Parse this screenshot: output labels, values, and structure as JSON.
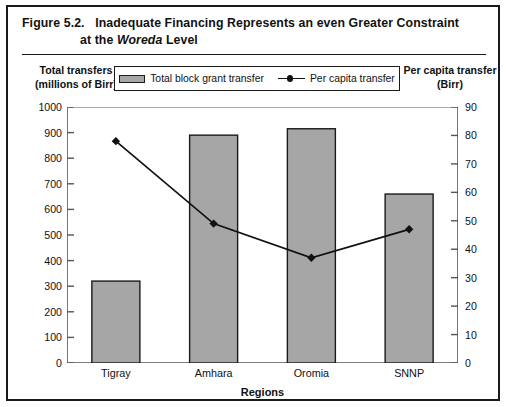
{
  "figure": {
    "number": "Figure 5.2.",
    "title_line1": "Inadequate Financing Represents an even Greater Constraint",
    "title_line2_prefix": "at the ",
    "title_line2_italic": "Woreda",
    "title_line2_suffix": " Level"
  },
  "legend": {
    "position": "top-center",
    "items": [
      {
        "label": "Total block grant transfer",
        "marker": "filled-rect-swatch",
        "color": "#a6a6a6"
      },
      {
        "label": "Per capita transfer",
        "marker": "line-with-dot",
        "color": "#111111"
      }
    ]
  },
  "axes": {
    "left_title_line1": "Total transfers",
    "left_title_line2": "(millions of Birr)",
    "right_title_line1": "Per capita transfer",
    "right_title_line2": "(Birr)",
    "x_title": "Regions",
    "left_ticks": [
      "1000",
      "900",
      "800",
      "700",
      "600",
      "500",
      "400",
      "300",
      "200",
      "100",
      "0"
    ],
    "right_ticks": [
      "90",
      "80",
      "70",
      "60",
      "50",
      "40",
      "30",
      "20",
      "10",
      "0"
    ]
  },
  "chart_data": {
    "type": "bar",
    "title": "Inadequate Financing Represents an even Greater Constraint at the Woreda Level",
    "xlabel": "Regions",
    "ylabel": "Total transfers (millions of Birr)",
    "y2label": "Per capita transfer (Birr)",
    "categories": [
      "Tigray",
      "Amhara",
      "Oromia",
      "SNNP"
    ],
    "ylim": [
      0,
      1000
    ],
    "y2lim": [
      0,
      90
    ],
    "grid": false,
    "legend_position": "top-center",
    "series": [
      {
        "name": "Total block grant transfer",
        "type": "bar",
        "axis": "left",
        "color": "#a6a6a6",
        "edge_color": "#1a1a1a",
        "values": [
          320,
          890,
          915,
          660
        ]
      },
      {
        "name": "Per capita transfer",
        "type": "line",
        "axis": "right",
        "color": "#111111",
        "marker": "diamond",
        "values": [
          78,
          49,
          37,
          47
        ]
      }
    ]
  }
}
